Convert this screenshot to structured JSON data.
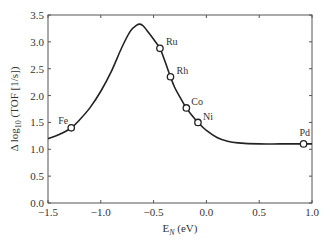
{
  "chart_data": {
    "type": "line",
    "title": "",
    "xlabel": "E_N (eV)",
    "ylabel": "Δ log10 (TOF [1/s])",
    "xlim": [
      -1.5,
      1.0
    ],
    "ylim": [
      0.0,
      3.5
    ],
    "xticks": [
      -1.5,
      -1.0,
      -0.5,
      0.0,
      0.5,
      1.0
    ],
    "xtick_labels": [
      "−1.5",
      "−1.0",
      "−0.5",
      "0.0",
      "0.5",
      "1.0"
    ],
    "yticks": [
      0.0,
      0.5,
      1.0,
      1.5,
      2.0,
      2.5,
      3.0,
      3.5
    ],
    "ytick_labels": [
      "0.0",
      "0.5",
      "1.0",
      "1.5",
      "2.0",
      "2.5",
      "3.0",
      "3.5"
    ],
    "grid": false,
    "legend": null,
    "series": [
      {
        "name": "volcano curve",
        "style": "solid line",
        "x": [
          -1.5,
          -1.4,
          -1.28,
          -1.2,
          -1.1,
          -1.0,
          -0.9,
          -0.8,
          -0.72,
          -0.66,
          -0.63,
          -0.6,
          -0.55,
          -0.5,
          -0.44,
          -0.4,
          -0.34,
          -0.3,
          -0.25,
          -0.19,
          -0.14,
          -0.08,
          0.0,
          0.1,
          0.2,
          0.3,
          0.5,
          0.7,
          0.92,
          1.0
        ],
        "y": [
          1.2,
          1.27,
          1.4,
          1.55,
          1.78,
          2.08,
          2.45,
          2.9,
          3.2,
          3.31,
          3.33,
          3.3,
          3.18,
          3.05,
          2.88,
          2.68,
          2.35,
          2.15,
          1.97,
          1.77,
          1.64,
          1.5,
          1.35,
          1.22,
          1.15,
          1.12,
          1.1,
          1.1,
          1.1,
          1.1
        ]
      },
      {
        "name": "metals",
        "style": "open circles",
        "points": [
          {
            "label": "Fe",
            "x": -1.28,
            "y": 1.4
          },
          {
            "label": "Ru",
            "x": -0.44,
            "y": 2.88
          },
          {
            "label": "Rh",
            "x": -0.34,
            "y": 2.35
          },
          {
            "label": "Co",
            "x": -0.19,
            "y": 1.77
          },
          {
            "label": "Ni",
            "x": -0.08,
            "y": 1.5
          },
          {
            "label": "Pd",
            "x": 0.92,
            "y": 1.1
          }
        ]
      }
    ],
    "annotations": [
      "Fe",
      "Ru",
      "Rh",
      "Co",
      "Ni",
      "Pd"
    ]
  },
  "axes": {
    "xlabel_main": "E",
    "xlabel_sub": "N",
    "xlabel_unit": " (eV)",
    "ylabel_prefix": "Δ log",
    "ylabel_sub": "10",
    "ylabel_suffix": " (TOF [1/s])"
  }
}
